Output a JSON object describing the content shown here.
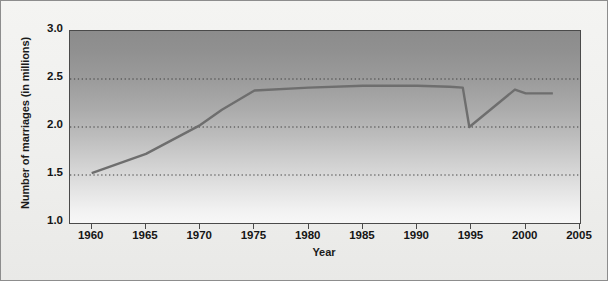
{
  "chart_data": {
    "type": "line",
    "title": "",
    "xlabel": "Year",
    "ylabel": "Number of marriages (in millions)",
    "xlim": [
      1958,
      2005
    ],
    "ylim": [
      1.0,
      3.0
    ],
    "grid": "horizontal-dotted",
    "legend": "none",
    "y_ticks": [
      {
        "value": 3.0,
        "label": "3.0"
      },
      {
        "value": 2.5,
        "label": "2.5"
      },
      {
        "value": 2.0,
        "label": "2.0"
      },
      {
        "value": 1.5,
        "label": "1.5"
      },
      {
        "value": 1.0,
        "label": "1.0"
      }
    ],
    "x_ticks": [
      {
        "value": 1960,
        "label": "1960"
      },
      {
        "value": 1965,
        "label": "1965"
      },
      {
        "value": 1970,
        "label": "1970"
      },
      {
        "value": 1975,
        "label": "1975"
      },
      {
        "value": 1980,
        "label": "1980"
      },
      {
        "value": 1985,
        "label": "1985"
      },
      {
        "value": 1990,
        "label": "1990"
      },
      {
        "value": 1995,
        "label": "1995"
      },
      {
        "value": 2000,
        "label": "2000"
      },
      {
        "value": 2005,
        "label": "2005"
      }
    ],
    "gridline_values": [
      2.5,
      2.0,
      1.5
    ],
    "series": [
      {
        "name": "Number of marriages",
        "color": "#6e6e6e",
        "x": [
          1960,
          1965,
          1970,
          1972,
          1975,
          1980,
          1985,
          1990,
          1993,
          1994.2,
          1994.8,
          1999,
          2000,
          2002.5
        ],
        "y": [
          1.52,
          1.72,
          2.02,
          2.18,
          2.38,
          2.41,
          2.43,
          2.43,
          2.42,
          2.41,
          2.0,
          2.39,
          2.35,
          2.35
        ]
      }
    ]
  }
}
